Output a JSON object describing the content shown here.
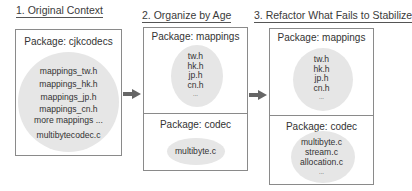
{
  "steps": [
    {
      "title": "1. Original Context",
      "packages": [
        {
          "label": "Package: cjkcodecs",
          "files": [
            "mappings_tw.h",
            "mappings_hk.h",
            "mappings_jp.h",
            "mappings_cn.h",
            "more mappings ...",
            "multibytecodec.c"
          ]
        }
      ]
    },
    {
      "title": "2. Organize by Age",
      "packages": [
        {
          "label": "Package: mappings",
          "files": [
            "tw.h",
            "hk.h",
            "jp.h",
            "cn.h",
            "..."
          ]
        },
        {
          "label": "Package: codec",
          "files": [
            "multibyte.c"
          ]
        }
      ]
    },
    {
      "title": "3. Refactor What Fails to Stabilize",
      "packages": [
        {
          "label": "Package: mappings",
          "files": [
            "tw.h",
            "hk.h",
            "jp.h",
            "cn.h",
            "..."
          ]
        },
        {
          "label": "Package: codec",
          "files": [
            "multibyte.c",
            "stream.c",
            "allocation.c",
            "..."
          ]
        }
      ]
    }
  ],
  "arrows": [
    "arrow-right-icon",
    "arrow-right-icon"
  ],
  "colors": {
    "border": "#8a8a8a",
    "blob": "#e6e6e6",
    "arrow": "#666666",
    "text": "#333333"
  }
}
